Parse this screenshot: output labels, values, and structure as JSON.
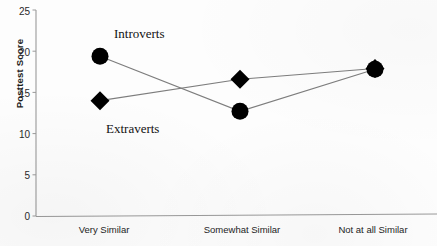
{
  "chart_data": {
    "type": "line",
    "title": "",
    "xlabel": "",
    "ylabel": "Posttest Score",
    "categories": [
      "Very Similar",
      "Somewhat  Similar",
      "Not at all Similar"
    ],
    "ylim": [
      0,
      25
    ],
    "yticks": [
      0,
      5,
      10,
      15,
      20,
      25
    ],
    "grid": false,
    "legend_position": "inline-annotations",
    "series": [
      {
        "name": "Introverts",
        "marker": "circle",
        "color": "#000000",
        "values": [
          19.4,
          12.7,
          17.8
        ]
      },
      {
        "name": "Extraverts",
        "marker": "diamond",
        "color": "#000000",
        "values": [
          14.0,
          16.6,
          17.9
        ]
      }
    ],
    "annotations": [
      {
        "text": "Introverts",
        "series": "Introverts"
      },
      {
        "text": "Extraverts",
        "series": "Extraverts"
      }
    ]
  },
  "axes": {
    "y_title": "Posttest Score",
    "y_tick_labels": [
      "25",
      "20",
      "15",
      "10",
      "5",
      "0"
    ],
    "x_tick_labels": [
      "Very Similar",
      "Somewhat  Similar",
      "Not at all Similar"
    ]
  },
  "labels": {
    "introverts": "Introverts",
    "extraverts": "Extraverts"
  }
}
